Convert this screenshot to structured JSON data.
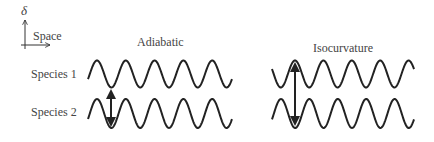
{
  "axes": {
    "y_symbol": "δ",
    "x_label": "Space"
  },
  "panels": [
    {
      "title": "Adiabatic",
      "phase": "in-phase"
    },
    {
      "title": "Isocurvature",
      "phase": "anti-phase"
    }
  ],
  "species": [
    {
      "label": "Species 1"
    },
    {
      "label": "Species 2"
    }
  ],
  "colors": {
    "stroke": "#222222",
    "text": "#444444"
  }
}
